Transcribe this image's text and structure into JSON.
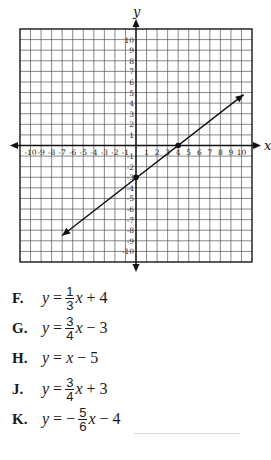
{
  "graph": {
    "x_axis_label": "x",
    "y_axis_label": "y",
    "x_ticks": [
      "-10",
      "-9",
      "-8",
      "-7",
      "-6",
      "-5",
      "-4",
      "-3",
      "-2",
      "-1",
      "1",
      "2",
      "3",
      "4",
      "5",
      "6",
      "7",
      "8",
      "9",
      "10"
    ],
    "y_ticks": [
      "10",
      "9",
      "8",
      "7",
      "6",
      "5",
      "4",
      "3",
      "2",
      "1",
      "-1",
      "-2",
      "-3",
      "-4",
      "-5",
      "-6",
      "-7",
      "-8",
      "-9",
      "-10"
    ],
    "range": [
      -11,
      11
    ],
    "points": [
      {
        "x": 0,
        "y": -3
      },
      {
        "x": 4,
        "y": 0
      }
    ],
    "line": {
      "from": {
        "x": -7,
        "y": -8.5
      },
      "to": {
        "x": 10.2,
        "y": 4.8
      }
    },
    "colors": {
      "grid": "#555555",
      "axis": "#111111",
      "line": "#111111"
    }
  },
  "choices": [
    {
      "letter": "F.",
      "lhs": "y",
      "eq": "=",
      "sign": "",
      "num": "1",
      "den": "3",
      "var": "x",
      "rest": "+ 4"
    },
    {
      "letter": "G.",
      "lhs": "y",
      "eq": "=",
      "sign": "",
      "num": "3",
      "den": "4",
      "var": "x",
      "rest": "− 3"
    },
    {
      "letter": "H.",
      "lhs": "y",
      "eq": "=",
      "sign": "",
      "num": "",
      "den": "",
      "var": "x",
      "rest": "− 5"
    },
    {
      "letter": "J.",
      "lhs": "y",
      "eq": "=",
      "sign": "",
      "num": "3",
      "den": "4",
      "var": "x",
      "rest": "+ 3"
    },
    {
      "letter": "K.",
      "lhs": "y",
      "eq": "=",
      "sign": "−",
      "num": "5",
      "den": "6",
      "var": "x",
      "rest": "− 4"
    }
  ]
}
